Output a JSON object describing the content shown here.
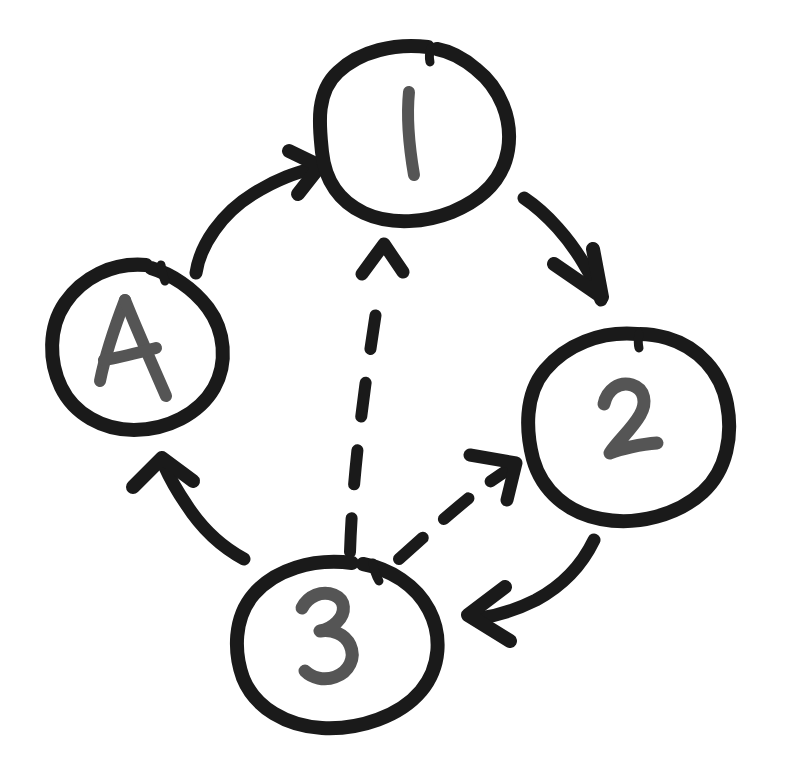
{
  "diagram": {
    "style": "hand-drawn sketch, black marker on white paper",
    "background_color": "#ffffff",
    "node_stroke_color": "#1a1a1a",
    "node_fill_color": "#ffffff",
    "node_label_color": "#555555",
    "edge_color": "#1a1a1a",
    "node_stroke_width": 14,
    "edge_stroke_width": 13,
    "dashed_edge_stroke_width": 12
  },
  "nodes": [
    {
      "id": "node-1",
      "label": "1",
      "cx": 415,
      "cy": 130,
      "rx": 95,
      "ry": 89
    },
    {
      "id": "node-2",
      "label": "2",
      "cx": 629,
      "cy": 426,
      "rx": 103,
      "ry": 94
    },
    {
      "id": "node-3",
      "label": "3",
      "cx": 338,
      "cy": 640,
      "rx": 104,
      "ry": 89
    },
    {
      "id": "node-4",
      "label": "4",
      "cx": 139,
      "cy": 346,
      "rx": 88,
      "ry": 85
    }
  ],
  "edges": [
    {
      "id": "edge-4-1",
      "from": "4",
      "to": "1",
      "style": "solid",
      "direction": "up-right",
      "arrowhead": "open-v"
    },
    {
      "id": "edge-1-2",
      "from": "1",
      "to": "2",
      "style": "solid",
      "direction": "down-right",
      "arrowhead": "open-v"
    },
    {
      "id": "edge-2-3",
      "from": "2",
      "to": "3",
      "style": "solid",
      "direction": "down-left",
      "arrowhead": "open-v"
    },
    {
      "id": "edge-3-4",
      "from": "3",
      "to": "4",
      "style": "solid",
      "direction": "up-left",
      "arrowhead": "open-v"
    },
    {
      "id": "edge-3-1",
      "from": "3",
      "to": "1",
      "style": "dashed",
      "direction": "up",
      "arrowhead": "open-v",
      "dash_count": 5
    },
    {
      "id": "edge-3-2",
      "from": "3",
      "to": "2",
      "style": "dashed",
      "direction": "up-right",
      "arrowhead": "open-v",
      "dash_count": 4
    }
  ]
}
